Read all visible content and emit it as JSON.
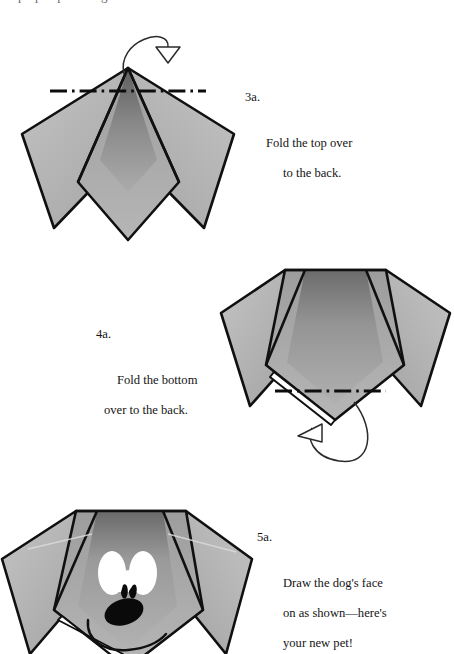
{
  "document": {
    "kind": "origami-instruction-diagram",
    "subject": "paper dog",
    "page_background": "#ffffff",
    "cropped_top_text": "pop up and give"
  },
  "palette": {
    "paper_light": "#b4b4b4",
    "paper_mid": "#a9a9a9",
    "paper_dark": "#6f6f6f",
    "paper_darkest": "#5c5c5c",
    "outline": "#101010",
    "eye_white": "#ffffff",
    "ink": "#000000",
    "text": "#141414",
    "arrow_line": "#2b2b2b"
  },
  "steps": [
    {
      "id": "3a",
      "number": "3a.",
      "lines": [
        "Fold the top over",
        "to the back."
      ],
      "text": "3a. Fold the top over to the back.",
      "fold_line_style": "dash-dot",
      "arrow": "fold-over-back-arrow",
      "figure_name": "figure-step-3a"
    },
    {
      "id": "4a",
      "number": "4a.",
      "lines": [
        "Fold the bottom",
        "over to the back."
      ],
      "text": "4a. Fold the bottom over to the back.",
      "fold_line_style": "dash-dot",
      "arrow": "fold-under-back-arrow",
      "figure_name": "figure-step-4a"
    },
    {
      "id": "5a",
      "number": "5a.",
      "lines": [
        "Draw the dog's face",
        "on as shown—here's",
        "your new pet!"
      ],
      "text": "5a. Draw the dog's face on as shown—here's your new pet!",
      "fold_line_style": "none",
      "arrow": "none",
      "figure_name": "figure-step-5a"
    }
  ],
  "figures": {
    "step_3a": {
      "label": "folded paper with pointed top and two ear flaps",
      "apex": [
        128,
        68
      ],
      "fold_line": {
        "x1": 50,
        "y1": 91,
        "x2": 206,
        "y2": 91
      }
    },
    "step_4a": {
      "label": "folded paper with flat top and two ear flaps",
      "top_edge": {
        "x1": 285,
        "y1": 270,
        "x2": 386,
        "y2": 270
      },
      "fold_line": {
        "x1": 275,
        "y1": 391,
        "x2": 386,
        "y2": 391
      }
    },
    "step_5a": {
      "label": "finished dog head with drawn face",
      "features": [
        "left-eye",
        "right-eye",
        "left-pupil",
        "right-pupil",
        "nose",
        "smile"
      ]
    }
  }
}
